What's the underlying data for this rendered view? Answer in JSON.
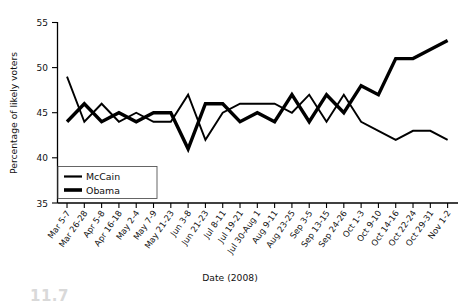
{
  "chart_data": {
    "type": "line",
    "title": "",
    "xlabel": "Date (2008)",
    "ylabel": "Percentage of likely voters",
    "ylim": [
      35,
      55
    ],
    "yticks": [
      35,
      40,
      45,
      50,
      55
    ],
    "grid": false,
    "legend_position": "bottom-left",
    "categories": [
      "Mar 5-7",
      "Mar 26-28",
      "Apr 5-8",
      "Apr 16-18",
      "May 2-4",
      "May 7-9",
      "May 21-23",
      "Jun 3-8",
      "Jun 21-23",
      "Jul 8-11",
      "Jul 19-21",
      "Jul 30-Aug 1",
      "Aug 9-11",
      "Aug 23-25",
      "Sep 3-5",
      "Sep 13-15",
      "Sep 24-26",
      "Oct 1-3",
      "Oct 9-10",
      "Oct 14-16",
      "Oct 22-24",
      "Oct 29-31",
      "Nov 1-2"
    ],
    "series": [
      {
        "name": "McCain",
        "values": [
          49,
          44,
          46,
          44,
          45,
          44,
          44,
          47,
          42,
          45,
          46,
          46,
          46,
          45,
          47,
          44,
          47,
          44,
          43,
          42,
          43,
          43,
          42
        ]
      },
      {
        "name": "Obama",
        "values": [
          44,
          46,
          44,
          45,
          44,
          45,
          45,
          41,
          46,
          46,
          44,
          45,
          44,
          47,
          44,
          47,
          45,
          48,
          47,
          51,
          51,
          52,
          53
        ]
      }
    ]
  },
  "axes": {
    "y_title": "Percentage of likely voters",
    "x_title": "Date (2008)",
    "y_tick_labels": [
      "35",
      "40",
      "45",
      "50",
      "55"
    ]
  },
  "legend": {
    "entries": [
      {
        "label": "McCain",
        "style": "thin"
      },
      {
        "label": "Obama",
        "style": "thick"
      }
    ]
  },
  "caption": {
    "partial_text": "11.7"
  }
}
